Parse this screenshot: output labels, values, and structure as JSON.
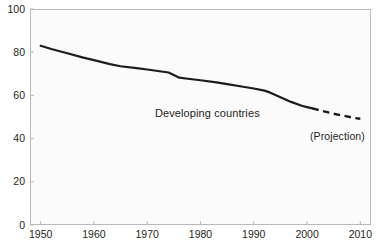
{
  "chart_data": {
    "type": "line",
    "title": "",
    "subtitle": "",
    "xlabel": "",
    "ylabel": "",
    "xlim": [
      1948,
      2012
    ],
    "ylim": [
      0,
      100
    ],
    "grid": false,
    "legend_position": "inline-annotation",
    "xticks": [
      1950,
      1960,
      1970,
      1980,
      1990,
      2000,
      2010
    ],
    "xtick_labels": [
      "1950",
      "1960",
      "1970",
      "1980",
      "1990",
      "2000",
      "2010"
    ],
    "yticks": [
      0,
      20,
      40,
      60,
      80,
      100
    ],
    "ytick_labels": [
      "0",
      "20",
      "40",
      "60",
      "80",
      "100"
    ],
    "annotations": [
      {
        "text": "Developing countries",
        "x": 1972,
        "y": 57
      },
      {
        "text": "(Projection)",
        "x": 2001,
        "y": 46
      }
    ],
    "series": [
      {
        "name": "Developing countries",
        "style": "solid",
        "color": "#1c1c20",
        "x": [
          1950,
          1952,
          1955,
          1958,
          1960,
          1963,
          1965,
          1968,
          1970,
          1972,
          1974,
          1975,
          1976,
          1978,
          1980,
          1983,
          1985,
          1988,
          1990,
          1992,
          1993,
          1995,
          1997,
          1999,
          2000,
          2001
        ],
        "values": [
          83.0,
          81.5,
          79.5,
          77.5,
          76.3,
          74.5,
          73.5,
          72.6,
          72.0,
          71.3,
          70.6,
          69.4,
          68.2,
          67.6,
          67.0,
          66.0,
          65.2,
          64.0,
          63.2,
          62.2,
          61.4,
          59.2,
          57.0,
          55.2,
          54.6,
          54.0
        ]
      },
      {
        "name": "Developing countries (projection)",
        "style": "dashed",
        "color": "#1c1c20",
        "x": [
          2001,
          2003,
          2005,
          2007,
          2009,
          2010
        ],
        "values": [
          54.0,
          52.7,
          51.5,
          50.5,
          49.5,
          49.2
        ]
      }
    ]
  },
  "axis": {
    "y_label_texts": [
      "100",
      "80",
      "60",
      "40",
      "20",
      "0"
    ],
    "x_label_texts": [
      "1950",
      "1960",
      "1970",
      "1980",
      "1990",
      "2000",
      "2010"
    ]
  },
  "labels": {
    "series_label": "Developing countries",
    "projection_label": "(Projection)"
  },
  "colors": {
    "line": "#1c1c20",
    "frame": "#b9b9bd",
    "plot_background": "#fbfbfc",
    "page_background": "#ffffff",
    "text": "#1f1f23"
  }
}
